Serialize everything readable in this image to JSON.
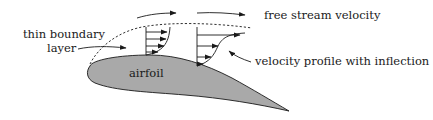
{
  "diagram": {
    "labels": {
      "free_stream": "free stream velocity",
      "boundary_line1": "thin boundary",
      "boundary_line2": "layer",
      "profile": "velocity profile with inflection",
      "airfoil": "airfoil"
    },
    "colors": {
      "airfoil_fill": "#a9a9a9",
      "ink": "#1a1a1a",
      "background": "#ffffff"
    },
    "profiles": [
      {
        "name": "attached-profile",
        "arrow_count": 4
      },
      {
        "name": "inflection-profile",
        "arrow_count": 4
      }
    ]
  }
}
